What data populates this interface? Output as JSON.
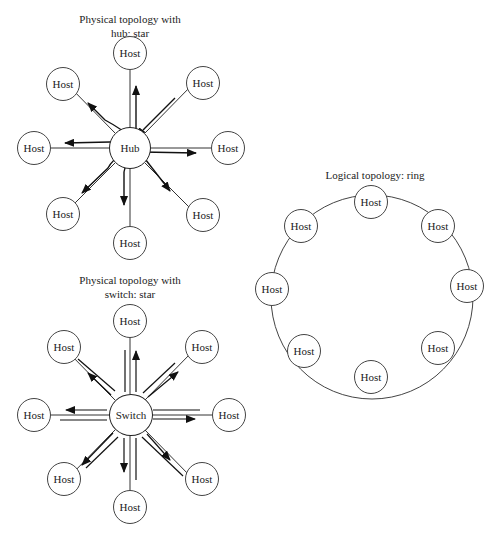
{
  "hub_diagram": {
    "title_line1": "Physical topology with",
    "title_line2": "hub: star",
    "center_label": "Hub",
    "hosts": [
      "Host",
      "Host",
      "Host",
      "Host",
      "Host",
      "Host",
      "Host",
      "Host"
    ]
  },
  "switch_diagram": {
    "title_line1": "Physical topology with",
    "title_line2": "switch: star",
    "center_label": "Switch",
    "hosts": [
      "Host",
      "Host",
      "Host",
      "Host",
      "Host",
      "Host",
      "Host",
      "Host"
    ]
  },
  "ring_diagram": {
    "title": "Logical topology: ring",
    "hosts": [
      "Host",
      "Host",
      "Host",
      "Host",
      "Host",
      "Host",
      "Host",
      "Host"
    ]
  }
}
